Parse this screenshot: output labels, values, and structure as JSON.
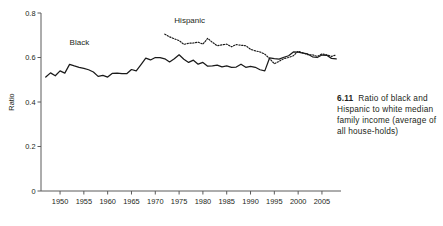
{
  "figure": {
    "caption_number": "6.11",
    "caption_text": "Ratio of black and Hispanic to white median family income (average of all house-holds)"
  },
  "chart_data": {
    "type": "line",
    "title": "",
    "xlabel": "",
    "ylabel": "Ratio",
    "xlim": [
      1946,
      2009
    ],
    "ylim": [
      0,
      0.8
    ],
    "grid": false,
    "legend": "inline-labels",
    "y_ticks": [
      "0",
      "0.2",
      "0.4",
      "0.6",
      "0.8"
    ],
    "y_tick_values": [
      0,
      0.2,
      0.4,
      0.6,
      0.8
    ],
    "x_ticks": [
      "1950",
      "1955",
      "1960",
      "1965",
      "1970",
      "1975",
      "1980",
      "1985",
      "1990",
      "1995",
      "2000",
      "2005"
    ],
    "x_tick_values": [
      1950,
      1955,
      1960,
      1965,
      1970,
      1975,
      1980,
      1985,
      1990,
      1995,
      2000,
      2005
    ],
    "annotations": [
      {
        "text": "Black",
        "x": 1952,
        "y": 0.655
      },
      {
        "text": "Hispanic",
        "x": 1974,
        "y": 0.755
      }
    ],
    "series": [
      {
        "name": "Black",
        "style": "solid",
        "color": "#1a1a1a",
        "x": [
          1947,
          1948,
          1949,
          1950,
          1951,
          1952,
          1953,
          1954,
          1955,
          1956,
          1957,
          1958,
          1959,
          1960,
          1961,
          1962,
          1963,
          1964,
          1965,
          1966,
          1967,
          1968,
          1969,
          1970,
          1971,
          1972,
          1973,
          1974,
          1975,
          1976,
          1977,
          1978,
          1979,
          1980,
          1981,
          1982,
          1983,
          1984,
          1985,
          1986,
          1987,
          1988,
          1989,
          1990,
          1991,
          1992,
          1993,
          1994,
          1995,
          1996,
          1997,
          1998,
          1999,
          2000,
          2001,
          2002,
          2003,
          2004,
          2005,
          2006,
          2007,
          2008
        ],
        "values": [
          0.512,
          0.531,
          0.518,
          0.54,
          0.53,
          0.569,
          0.562,
          0.556,
          0.551,
          0.545,
          0.535,
          0.515,
          0.52,
          0.512,
          0.529,
          0.53,
          0.527,
          0.527,
          0.546,
          0.54,
          0.568,
          0.597,
          0.589,
          0.6,
          0.599,
          0.594,
          0.58,
          0.594,
          0.612,
          0.592,
          0.578,
          0.588,
          0.57,
          0.578,
          0.561,
          0.562,
          0.566,
          0.558,
          0.562,
          0.556,
          0.557,
          0.57,
          0.556,
          0.56,
          0.556,
          0.545,
          0.54,
          0.598,
          0.595,
          0.593,
          0.601,
          0.608,
          0.625,
          0.624,
          0.62,
          0.616,
          0.603,
          0.6,
          0.611,
          0.61,
          0.596,
          0.594
        ]
      },
      {
        "name": "Hispanic",
        "style": "dotted",
        "color": "#1a1a1a",
        "x": [
          1972,
          1973,
          1974,
          1975,
          1976,
          1977,
          1978,
          1979,
          1980,
          1981,
          1982,
          1983,
          1984,
          1985,
          1986,
          1987,
          1988,
          1989,
          1990,
          1991,
          1992,
          1993,
          1994,
          1995,
          1996,
          1997,
          1998,
          1999,
          2000,
          2001,
          2002,
          2003,
          2004,
          2005,
          2006,
          2007,
          2008
        ],
        "values": [
          0.705,
          0.693,
          0.684,
          0.676,
          0.659,
          0.664,
          0.665,
          0.669,
          0.66,
          0.686,
          0.668,
          0.653,
          0.657,
          0.66,
          0.648,
          0.658,
          0.655,
          0.653,
          0.637,
          0.63,
          0.625,
          0.615,
          0.595,
          0.572,
          0.583,
          0.595,
          0.6,
          0.608,
          0.628,
          0.621,
          0.613,
          0.612,
          0.605,
          0.616,
          0.612,
          0.605,
          0.612
        ]
      }
    ]
  }
}
